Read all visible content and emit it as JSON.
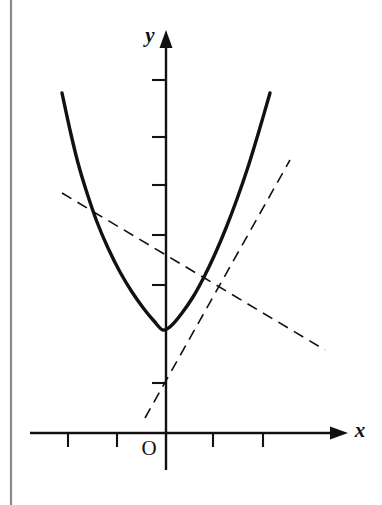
{
  "figure": {
    "kind": "cartesian-plot",
    "width": 382,
    "height": 505,
    "background_color": "#ffffff",
    "ink_color": "#111111",
    "page_edge_color": "#8a8a8a"
  },
  "labels": {
    "x_axis": "x",
    "y_axis": "y",
    "origin": "O"
  },
  "chart_data": {
    "type": "line",
    "title": "",
    "subtitle": "",
    "xlabel": "x",
    "ylabel": "y",
    "grid": false,
    "legend": null,
    "axes": {
      "origin_px": [
        166,
        433
      ],
      "unit_px": 49,
      "x_axis": {
        "y_px": 433,
        "start_px": 30,
        "end_px": 348,
        "arrow": "right",
        "tick_positions_px": [
          68,
          117,
          213,
          263
        ],
        "tick_values": [
          -2,
          -1,
          1,
          2
        ],
        "tick_labels": []
      },
      "y_axis": {
        "x_px": 166,
        "start_px": 470,
        "end_px": 30,
        "arrow": "up",
        "tick_positions_px": [
          80,
          137,
          185,
          235,
          285,
          383
        ],
        "tick_values": [
          7,
          6,
          5,
          4,
          3,
          -1
        ],
        "tick_labels": []
      },
      "xlim": [
        -2.8,
        3.7
      ],
      "ylim": [
        -1.3,
        8.2
      ]
    },
    "series": [
      {
        "name": "parabola",
        "role": "curve",
        "style": "solid",
        "stroke_width": 3.4,
        "color": "#111111",
        "vertex_px": [
          163,
          330
        ],
        "endpoints_px": [
          [
            62,
            93
          ],
          [
            270,
            93
          ]
        ],
        "path_points_px": [
          [
            62,
            93
          ],
          [
            70,
            130
          ],
          [
            78,
            163
          ],
          [
            87,
            193
          ],
          [
            97,
            222
          ],
          [
            108,
            248
          ],
          [
            120,
            272
          ],
          [
            132,
            292
          ],
          [
            144,
            309
          ],
          [
            154,
            321
          ],
          [
            163,
            330
          ],
          [
            172,
            325
          ],
          [
            182,
            313
          ],
          [
            193,
            297
          ],
          [
            204,
            277
          ],
          [
            215,
            254
          ],
          [
            226,
            228
          ],
          [
            237,
            199
          ],
          [
            248,
            167
          ],
          [
            259,
            131
          ],
          [
            270,
            93
          ]
        ]
      },
      {
        "name": "secant-line",
        "role": "dashed-line-descending",
        "style": "dashed",
        "stroke_width": 1.6,
        "dash_pattern": "11 7",
        "color": "#111111",
        "start_px": [
          62,
          193
        ],
        "end_px": [
          325,
          350
        ]
      },
      {
        "name": "tangent-line",
        "role": "dashed-line-ascending",
        "style": "dashed",
        "stroke_width": 1.6,
        "dash_pattern": "11 7",
        "color": "#111111",
        "start_px": [
          145,
          418
        ],
        "end_px": [
          290,
          160
        ],
        "y_intercept_px": [
          166,
          383
        ]
      }
    ],
    "annotations": [
      {
        "text": "y",
        "position_px": [
          150,
          42
        ],
        "style": "italic-bold"
      },
      {
        "text": "x",
        "position_px": [
          360,
          437
        ],
        "style": "italic-bold"
      },
      {
        "text": "O",
        "position_px": [
          149,
          455
        ],
        "style": "upright"
      }
    ]
  },
  "page_edge": {
    "x_px": 11,
    "top_px": 0,
    "bottom_px": 505
  }
}
